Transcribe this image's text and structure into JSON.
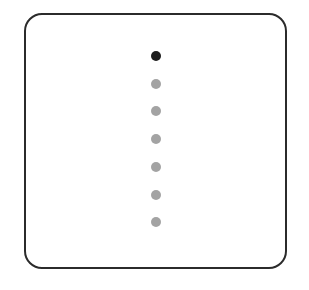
{
  "pagination": {
    "orientation": "vertical",
    "total_pages": 7,
    "current_page": 1,
    "active_color": "#1c1c1c",
    "inactive_color": "#a3a3a3",
    "dots": [
      {
        "page": 1,
        "active": true
      },
      {
        "page": 2,
        "active": false
      },
      {
        "page": 3,
        "active": false
      },
      {
        "page": 4,
        "active": false
      },
      {
        "page": 5,
        "active": false
      },
      {
        "page": 6,
        "active": false
      },
      {
        "page": 7,
        "active": false
      }
    ]
  }
}
